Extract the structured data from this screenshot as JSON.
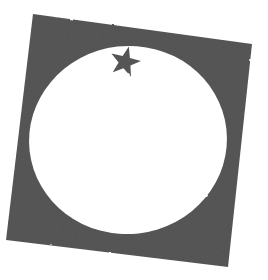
{
  "document": {
    "title": "Rotated Square with Circular Cutout and Star",
    "type": "abstract-shape-illustration",
    "canvas": {
      "width": 268,
      "height": 280,
      "background_color": "#ffffff"
    }
  },
  "palette": {
    "shape_fill": "#585858",
    "shape_fill_light": "#6a6a6a",
    "shape_fill_dark": "#4a4a4a",
    "background": "#ffffff",
    "cutout": "#ffffff"
  },
  "shapes": {
    "square": {
      "name": "rotated-square",
      "fill": "#585858",
      "rotation_degrees": -6.5,
      "corners": [
        {
          "label": "top-left",
          "x": 33,
          "y": 14
        },
        {
          "label": "top-right",
          "x": 252,
          "y": 44
        },
        {
          "label": "bottom-right",
          "x": 228,
          "y": 267
        },
        {
          "label": "bottom-left",
          "x": 6,
          "y": 240
        }
      ],
      "points_attr": "33,14 252,44 228,267 6,240"
    },
    "circle": {
      "name": "circle-cutout",
      "fill": "#ffffff",
      "center_x": 128,
      "center_y": 140,
      "radius_x": 99,
      "radius_y": 94,
      "rotation_degrees": -6.5
    },
    "star": {
      "name": "five-pointed-star",
      "fill": "#585858",
      "points": 5,
      "center_x": 125,
      "center_y": 62,
      "outer_radius": 16,
      "inner_radius": 6.4,
      "rotation_degrees": 14,
      "points_attr": "125.00,46.00 128.92,57.15 140.22,53.47 133.58,63.45 145.22,65.24 134.78,70.71 141.55,80.60 130.16,76.75 125.00,87.60 119.84,76.75 108.45,80.60 115.22,70.71 104.78,65.24 116.42,63.45 109.78,53.47 121.08,57.15"
    }
  },
  "texture": {
    "name": "grain-noise",
    "description": "fine speckled grain over the dark fill",
    "opacity": 0.22
  }
}
